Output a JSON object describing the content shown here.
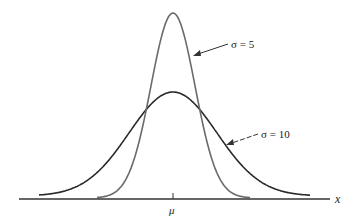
{
  "chart_data": {
    "type": "line",
    "title": "",
    "xlabel": "x",
    "ylabel": "",
    "x_tick_labels": [
      "μ"
    ],
    "grid": false,
    "legend_position": "annotations",
    "series": [
      {
        "name": "σ = 5",
        "sigma": 5,
        "mean": "μ",
        "label": "σ = 5",
        "relative_peak_height": 1.0
      },
      {
        "name": "σ = 10",
        "sigma": 10,
        "mean": "μ",
        "label": "σ = 10",
        "relative_peak_height": 0.5
      }
    ],
    "x_range_in_sigma5_units": [
      -3.8,
      3.8
    ],
    "annotations": [
      {
        "text": "σ = 5",
        "arrow_to": "right flank of σ = 5 curve"
      },
      {
        "text": "σ = 10",
        "arrow_to": "right flank of σ = 10 curve"
      }
    ]
  },
  "labels": {
    "axis_x": "x",
    "mu": "μ",
    "sigma5": "σ = 5",
    "sigma10": "σ = 10"
  },
  "colors": {
    "curve_sigma5": "#6a6a6a",
    "curve_sigma10": "#2a2a2a",
    "axis": "#333333"
  }
}
